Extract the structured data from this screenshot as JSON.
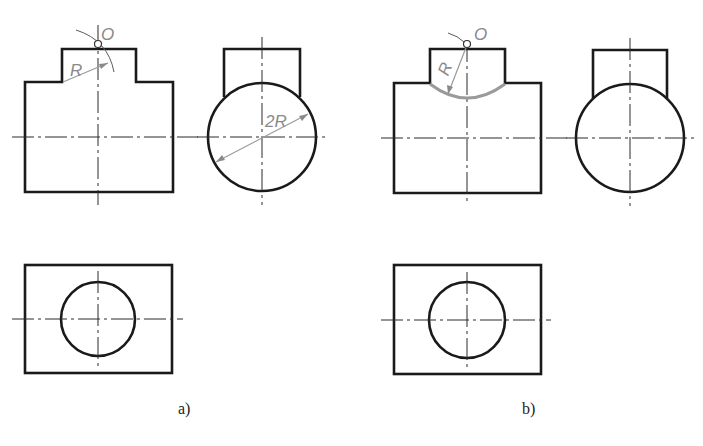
{
  "figure": {
    "panels": [
      {
        "caption": "a)",
        "point_label": "O",
        "radius_label": "R",
        "diameter_label": "2R"
      },
      {
        "caption": "b)",
        "point_label": "O",
        "radius_label": "R"
      }
    ],
    "colors": {
      "outline": "#1a1a1a",
      "construction": "#9a9a9a",
      "background": "#ffffff"
    }
  }
}
